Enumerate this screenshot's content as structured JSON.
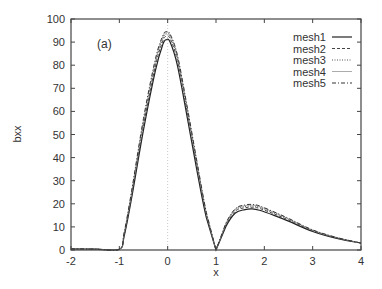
{
  "chart_data": {
    "type": "line",
    "title": "",
    "annotation": "(a)",
    "xlabel": "x",
    "ylabel": "bxx",
    "xlim": [
      -2,
      4
    ],
    "ylim": [
      0,
      100
    ],
    "xticks": [
      -2,
      -1,
      0,
      1,
      2,
      3,
      4
    ],
    "yticks": [
      0,
      10,
      20,
      30,
      40,
      50,
      60,
      70,
      80,
      90,
      100
    ],
    "grid": false,
    "reference_lines": [
      {
        "orientation": "vertical",
        "x": 0,
        "style": "dotted"
      }
    ],
    "legend": {
      "position": "top-right",
      "entries": [
        "mesh1",
        "mesh2",
        "mesh3",
        "mesh4",
        "mesh5"
      ]
    },
    "series": [
      {
        "name": "mesh1",
        "style": "solid",
        "x": [
          -2,
          -1.5,
          -1.0,
          -0.9,
          -0.75,
          -0.5,
          -0.25,
          -0.1,
          -0.03,
          0.05,
          0.2,
          0.4,
          0.6,
          0.8,
          1.0,
          1.2,
          1.4,
          1.6,
          1.75,
          1.9,
          2.2,
          2.5,
          3.0,
          3.5,
          4.0
        ],
        "y": [
          0.5,
          0.4,
          0.3,
          6,
          22,
          52,
          78,
          89,
          91,
          90,
          80,
          58,
          35,
          14,
          0,
          10,
          16,
          17.5,
          17.8,
          17.2,
          15,
          12.5,
          8,
          5,
          3
        ]
      },
      {
        "name": "mesh2",
        "style": "dashed",
        "x": [
          -2,
          -1.5,
          -1.0,
          -0.9,
          -0.75,
          -0.5,
          -0.25,
          -0.1,
          -0.03,
          0.05,
          0.2,
          0.4,
          0.6,
          0.8,
          1.0,
          1.2,
          1.4,
          1.6,
          1.75,
          1.9,
          2.2,
          2.5,
          3.0,
          3.5,
          4.0
        ],
        "y": [
          0.5,
          0.4,
          0.3,
          6.5,
          23,
          54,
          80,
          90.5,
          92.5,
          91.5,
          82,
          60,
          37,
          15,
          0,
          10.5,
          16.8,
          18.3,
          18.5,
          18,
          15.6,
          13,
          8.3,
          5.2,
          3
        ]
      },
      {
        "name": "mesh3",
        "style": "dotted",
        "x": [
          -2,
          -1.5,
          -1.0,
          -0.9,
          -0.75,
          -0.5,
          -0.25,
          -0.1,
          -0.03,
          0.05,
          0.2,
          0.4,
          0.6,
          0.8,
          1.0,
          1.2,
          1.4,
          1.6,
          1.75,
          1.9,
          2.2,
          2.5,
          3.0,
          3.5,
          4.0
        ],
        "y": [
          0.5,
          0.4,
          0.3,
          7,
          24,
          55,
          81,
          91.5,
          93.5,
          92.5,
          83,
          61,
          38,
          15.5,
          0,
          11,
          17.3,
          18.8,
          19,
          18.5,
          16,
          13.3,
          8.5,
          5.3,
          3
        ]
      },
      {
        "name": "mesh4",
        "style": "solid-light",
        "x": [
          -2,
          -1.5,
          -1.0,
          -0.9,
          -0.75,
          -0.5,
          -0.25,
          -0.1,
          -0.03,
          0.05,
          0.2,
          0.4,
          0.6,
          0.8,
          1.0,
          1.2,
          1.4,
          1.6,
          1.75,
          1.9,
          2.2,
          2.5,
          3.0,
          3.5,
          4.0
        ],
        "y": [
          0.5,
          0.4,
          0.3,
          7.3,
          24.5,
          56,
          82,
          92.3,
          94,
          93,
          84,
          62,
          38.5,
          16,
          0,
          11.2,
          17.6,
          19.2,
          19.4,
          18.8,
          16.3,
          13.5,
          8.6,
          5.4,
          3
        ]
      },
      {
        "name": "mesh5",
        "style": "dash-dot",
        "x": [
          -2,
          -1.5,
          -1.0,
          -0.9,
          -0.75,
          -0.5,
          -0.25,
          -0.1,
          -0.03,
          0.05,
          0.2,
          0.4,
          0.6,
          0.8,
          1.0,
          1.2,
          1.4,
          1.6,
          1.75,
          1.9,
          2.2,
          2.5,
          3.0,
          3.5,
          4.0
        ],
        "y": [
          0.5,
          0.4,
          0.3,
          7.6,
          25,
          57,
          83,
          92.8,
          94.5,
          93.5,
          84.5,
          62.5,
          39,
          16.3,
          0,
          11.4,
          17.9,
          19.5,
          19.7,
          19.1,
          16.5,
          13.7,
          8.7,
          5.4,
          3
        ]
      }
    ]
  },
  "colors": {
    "axis": "#444444",
    "series": [
      "#222222",
      "#444444",
      "#555555",
      "#888888",
      "#333333"
    ],
    "reference": "#bbbbbb"
  }
}
